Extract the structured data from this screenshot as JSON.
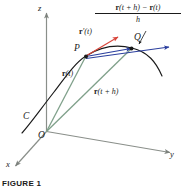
{
  "figure": {
    "caption": "FIGURE 1",
    "colors": {
      "axis": "#8a8f8a",
      "curve": "#1a1a1a",
      "position_vector": "#7fa08a",
      "secant": "#2b3f9e",
      "tangent": "#d8453a",
      "text": "#1a1a1a",
      "background": "#ffffff"
    },
    "axes": [
      {
        "name": "z-axis",
        "label": "z"
      },
      {
        "name": "y-axis",
        "label": "y"
      },
      {
        "name": "x-axis",
        "label": "x"
      }
    ],
    "points": [
      {
        "name": "origin",
        "label": "O"
      },
      {
        "name": "point-p",
        "label": "P"
      },
      {
        "name": "point-q",
        "label": "Q"
      }
    ],
    "curve_label": "C",
    "vectors": {
      "r_t": {
        "bold": "r",
        "rest": "(t)"
      },
      "r_t_plus_h": {
        "bold": "r",
        "rest": "(t + h)"
      },
      "r_prime_t": {
        "bold": "r",
        "prime": "′",
        "rest": "(t)"
      }
    },
    "difference_quotient": {
      "numerator_bold_1": "r",
      "numerator_mid": "(t + h) − ",
      "numerator_bold_2": "r",
      "numerator_end": "(t)",
      "denominator": "h"
    }
  }
}
